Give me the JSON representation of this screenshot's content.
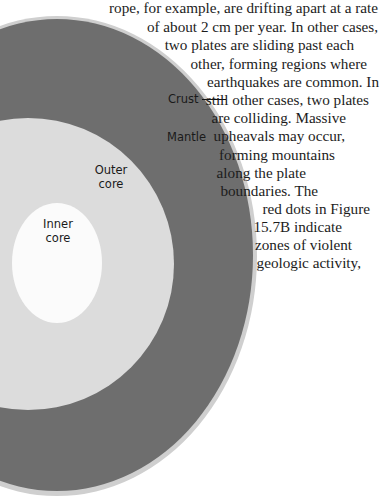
{
  "diagram": {
    "labels": {
      "crust": "Crust",
      "mantle": "Mantle",
      "outer_core_line1": "Outer",
      "outer_core_line2": "core",
      "inner_core_line1": "Inner",
      "inner_core_line2": "core"
    },
    "colors": {
      "crust": "#cfcfcf",
      "mantle": "#6e6e6e",
      "outer_core": "#dcdcdc",
      "inner_core": "#fbfbfb"
    }
  },
  "body_text": {
    "lines": [
      "rope, for example, are drifting apart at a rate",
      "of about 2 cm per year. In other cases,",
      "two plates are sliding past each",
      "other, forming regions where",
      "earthquakes are common. In",
      "still other cases, two plates",
      "are colliding. Massive",
      "upheavals may occur,",
      "forming mountains",
      "along the plate",
      "boundaries. The",
      "red dots in Figure",
      "15.7B indicate",
      "zones of violent",
      "geologic activity,",
      "most of which are"
    ]
  }
}
